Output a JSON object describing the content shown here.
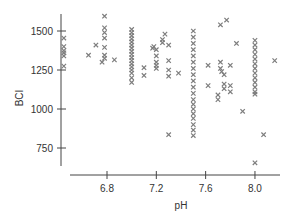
{
  "chart_data": {
    "type": "scatter",
    "title": "",
    "xlabel": "pH",
    "ylabel": "BCI",
    "xlim": [
      6.35,
      8.25
    ],
    "ylim": [
      620,
      1640
    ],
    "xticks": [
      6.8,
      7.2,
      7.6,
      8.0
    ],
    "xtick_labels": [
      "6.8",
      "7.2",
      "7.6",
      "8.0"
    ],
    "yticks": [
      750,
      1000,
      1250,
      1500
    ],
    "ytick_labels": [
      "750",
      "1000",
      "1250",
      "1500"
    ],
    "grid": false,
    "legend": null,
    "marker": "x",
    "marker_color": "#7d7d7d",
    "series": [
      {
        "name": "samples",
        "points": [
          [
            6.45,
            1455
          ],
          [
            6.45,
            1400
          ],
          [
            6.45,
            1375
          ],
          [
            6.45,
            1360
          ],
          [
            6.45,
            1340
          ],
          [
            6.45,
            1275
          ],
          [
            6.65,
            1345
          ],
          [
            6.71,
            1410
          ],
          [
            6.78,
            1595
          ],
          [
            6.78,
            1520
          ],
          [
            6.78,
            1490
          ],
          [
            6.78,
            1455
          ],
          [
            6.78,
            1395
          ],
          [
            6.78,
            1345
          ],
          [
            6.78,
            1325
          ],
          [
            6.76,
            1300
          ],
          [
            6.86,
            1315
          ],
          [
            7.0,
            1510
          ],
          [
            7.0,
            1490
          ],
          [
            7.0,
            1470
          ],
          [
            7.0,
            1450
          ],
          [
            7.0,
            1430
          ],
          [
            7.0,
            1410
          ],
          [
            7.0,
            1390
          ],
          [
            7.0,
            1370
          ],
          [
            7.0,
            1350
          ],
          [
            7.0,
            1330
          ],
          [
            7.0,
            1310
          ],
          [
            7.0,
            1290
          ],
          [
            7.0,
            1270
          ],
          [
            7.0,
            1250
          ],
          [
            7.0,
            1230
          ],
          [
            7.0,
            1200
          ],
          [
            7.0,
            1170
          ],
          [
            7.1,
            1265
          ],
          [
            7.1,
            1215
          ],
          [
            7.17,
            1390
          ],
          [
            7.18,
            1400
          ],
          [
            7.2,
            1380
          ],
          [
            7.2,
            1340
          ],
          [
            7.2,
            1300
          ],
          [
            7.2,
            1280
          ],
          [
            7.2,
            1260
          ],
          [
            7.25,
            1445
          ],
          [
            7.25,
            1425
          ],
          [
            7.27,
            1480
          ],
          [
            7.3,
            1410
          ],
          [
            7.3,
            1310
          ],
          [
            7.3,
            1250
          ],
          [
            7.3,
            1210
          ],
          [
            7.3,
            835
          ],
          [
            7.38,
            1230
          ],
          [
            7.5,
            1500
          ],
          [
            7.5,
            1460
          ],
          [
            7.5,
            1420
          ],
          [
            7.5,
            1380
          ],
          [
            7.5,
            1340
          ],
          [
            7.5,
            1300
          ],
          [
            7.5,
            1260
          ],
          [
            7.5,
            1220
          ],
          [
            7.5,
            1180
          ],
          [
            7.5,
            1140
          ],
          [
            7.5,
            1100
          ],
          [
            7.5,
            1060
          ],
          [
            7.5,
            1030
          ],
          [
            7.5,
            1000
          ],
          [
            7.5,
            970
          ],
          [
            7.5,
            940
          ],
          [
            7.5,
            900
          ],
          [
            7.5,
            865
          ],
          [
            7.5,
            830
          ],
          [
            7.62,
            1280
          ],
          [
            7.62,
            1150
          ],
          [
            7.7,
            1090
          ],
          [
            7.7,
            1060
          ],
          [
            7.72,
            1540
          ],
          [
            7.72,
            1300
          ],
          [
            7.72,
            1260
          ],
          [
            7.73,
            1240
          ],
          [
            7.75,
            1220
          ],
          [
            7.75,
            1160
          ],
          [
            7.75,
            1130
          ],
          [
            7.77,
            1570
          ],
          [
            7.8,
            1280
          ],
          [
            7.8,
            1150
          ],
          [
            7.8,
            1110
          ],
          [
            7.85,
            1420
          ],
          [
            7.9,
            985
          ],
          [
            8.0,
            1440
          ],
          [
            8.0,
            1410
          ],
          [
            8.0,
            1380
          ],
          [
            8.0,
            1350
          ],
          [
            8.0,
            1320
          ],
          [
            8.0,
            1290
          ],
          [
            8.0,
            1260
          ],
          [
            8.0,
            1230
          ],
          [
            8.0,
            1200
          ],
          [
            8.0,
            1170
          ],
          [
            8.0,
            1140
          ],
          [
            8.0,
            1110
          ],
          [
            8.0,
            1095
          ],
          [
            8.0,
            655
          ],
          [
            8.07,
            835
          ],
          [
            8.16,
            1310
          ]
        ]
      }
    ]
  }
}
